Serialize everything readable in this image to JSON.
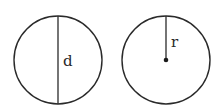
{
  "diagram": {
    "type": "geometry",
    "colors": {
      "stroke": "#2a2a2a",
      "background": "#ffffff"
    },
    "figures": [
      {
        "name": "circle-with-diameter",
        "center": [
          58,
          60
        ],
        "radius": 44,
        "segment": {
          "kind": "diameter",
          "from": [
            58,
            16
          ],
          "to": [
            58,
            104
          ]
        },
        "label": "d",
        "label_pos": [
          63,
          66
        ]
      },
      {
        "name": "circle-with-radius",
        "center": [
          166,
          60
        ],
        "radius": 44,
        "segment": {
          "kind": "radius",
          "from": [
            166,
            16
          ],
          "to": [
            166,
            60
          ]
        },
        "center_dot": true,
        "label": "r",
        "label_pos": [
          171,
          47
        ]
      }
    ]
  }
}
